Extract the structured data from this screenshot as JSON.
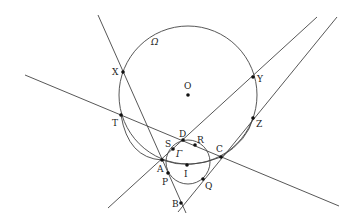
{
  "diagram": {
    "type": "geometry",
    "circles": [
      {
        "name": "Ω",
        "label": "Ω",
        "center": "O",
        "cx": 188,
        "cy": 95,
        "r": 69
      },
      {
        "name": "Γ",
        "label": "Γ",
        "cx": 188,
        "cy": 162,
        "r": 22
      }
    ],
    "arcs": [
      {
        "name": "arc-AIC",
        "through": [
          "A",
          "I",
          "C"
        ]
      }
    ],
    "lines": [
      {
        "name": "line-XAB",
        "x1": 98,
        "y1": 15,
        "x2": 186,
        "y2": 213
      },
      {
        "name": "line-TDC",
        "x1": 25,
        "y1": 75,
        "x2": 339,
        "y2": 206
      },
      {
        "name": "line-ADY",
        "x1": 108,
        "y1": 208,
        "x2": 317,
        "y2": 17
      },
      {
        "name": "line-BCZ",
        "x1": 178,
        "y1": 212,
        "x2": 337,
        "y2": 17
      }
    ],
    "points": [
      {
        "id": "X",
        "label": "X",
        "x": 123,
        "y": 72,
        "lx": 112,
        "ly": 75
      },
      {
        "id": "Y",
        "label": "Y",
        "x": 253,
        "y": 77,
        "lx": 257,
        "ly": 82
      },
      {
        "id": "O",
        "label": "O",
        "x": 188,
        "y": 95,
        "lx": 184,
        "ly": 89
      },
      {
        "id": "T",
        "label": "T",
        "x": 121,
        "y": 115,
        "lx": 112,
        "ly": 126
      },
      {
        "id": "Z",
        "label": "Z",
        "x": 253,
        "y": 118,
        "lx": 256,
        "ly": 127
      },
      {
        "id": "D",
        "label": "D",
        "x": 183,
        "y": 140,
        "lx": 179,
        "ly": 137
      },
      {
        "id": "S",
        "label": "S",
        "x": 173,
        "y": 149,
        "lx": 165,
        "ly": 147
      },
      {
        "id": "R",
        "label": "R",
        "x": 195,
        "y": 145,
        "lx": 197,
        "ly": 143
      },
      {
        "id": "C",
        "label": "C",
        "x": 221,
        "y": 157,
        "lx": 216,
        "ly": 152
      },
      {
        "id": "A",
        "label": "A",
        "x": 162,
        "y": 160,
        "lx": 157,
        "ly": 172
      },
      {
        "id": "I",
        "label": "I",
        "x": 187,
        "y": 165,
        "lx": 184,
        "ly": 177
      },
      {
        "id": "P",
        "label": "P",
        "x": 168,
        "y": 173,
        "lx": 162,
        "ly": 185
      },
      {
        "id": "Q",
        "label": "Q",
        "x": 203,
        "y": 179,
        "lx": 205,
        "ly": 189
      },
      {
        "id": "B",
        "label": "B",
        "x": 181,
        "y": 203,
        "lx": 172,
        "ly": 207
      }
    ],
    "labels": {
      "omega": {
        "text": "Ω",
        "x": 151,
        "y": 45
      },
      "gamma": {
        "text": "Γ",
        "x": 176,
        "y": 157
      }
    }
  }
}
